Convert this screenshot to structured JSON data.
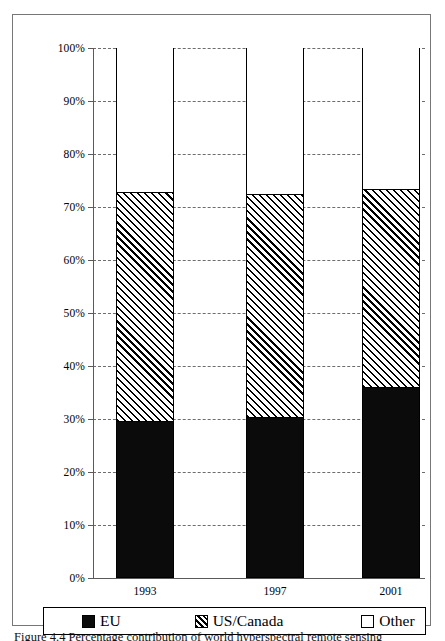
{
  "chart_data": {
    "type": "bar",
    "subtype": "stacked-100-percent",
    "title": "",
    "xlabel": "",
    "ylabel": "",
    "categories": [
      "1993",
      "1997",
      "2001"
    ],
    "series": [
      {
        "name": "EU",
        "values": [
          29.4,
          30.2,
          35.8
        ],
        "fill": "solid-black"
      },
      {
        "name": "US/Canada",
        "values": [
          43.2,
          42.1,
          37.4
        ],
        "fill": "diagonal-hatch"
      },
      {
        "name": "Other",
        "values": [
          27.4,
          27.7,
          26.8
        ],
        "fill": "white"
      }
    ],
    "cumulative_tops": [
      {
        "category": "1993",
        "eu_top": 29.4,
        "us_canada_top": 72.6,
        "other_top": 100
      },
      {
        "category": "1997",
        "eu_top": 30.2,
        "us_canada_top": 72.3,
        "other_top": 100
      },
      {
        "category": "2001",
        "eu_top": 35.8,
        "us_canada_top": 73.2,
        "other_top": 100
      }
    ],
    "ylim": [
      0,
      100
    ],
    "ytick_values": [
      0,
      10,
      20,
      30,
      40,
      50,
      60,
      70,
      80,
      90,
      100
    ],
    "ytick_labels": [
      "0%",
      "10%",
      "20%",
      "30%",
      "40%",
      "50%",
      "60%",
      "70%",
      "80%",
      "90%",
      "100%"
    ],
    "grid": true,
    "grid_style": "dashed-horizontal",
    "legend_position": "bottom",
    "legend_entries": [
      "EU",
      "US/Canada",
      "Other"
    ],
    "colors": {
      "eu": "#0b0b0b",
      "us_canada": "#ffffff",
      "other": "#ffffff",
      "outline": "#000000",
      "gridline": "#6d6d6d",
      "axis": "#5a5a5a"
    }
  },
  "legend": {
    "items": [
      {
        "label": "EU",
        "swatch": "black-square-icon"
      },
      {
        "label": "US/Canada",
        "swatch": "hatched-square-icon"
      },
      {
        "label": "Other",
        "swatch": "white-square-icon"
      }
    ]
  },
  "caption": {
    "text": "Figure 4.4 Percentage contribution of world hyperspectral remote sensing"
  }
}
